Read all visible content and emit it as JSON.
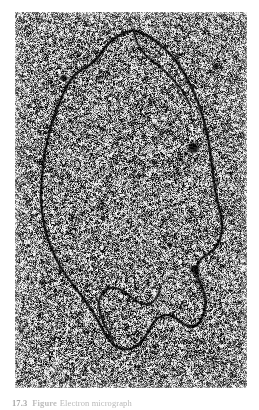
{
  "page": {
    "width": 259,
    "height": 410,
    "background_color": "#ffffff",
    "kind": "printed-book-page-figure"
  },
  "figure": {
    "alt_description": "Transmission electron micrograph of a closed circular DNA molecule spread on a grainy stained support film",
    "plate": {
      "x": 15,
      "y": 12,
      "width": 232,
      "height": 376,
      "background_mean_gray": "#8b8b8b",
      "grain_dark": "#171717",
      "grain_light": "#f2f2f2",
      "contrast_note": "very high contrast speckle, near black-and-white salt-and-pepper grain"
    },
    "specimen": {
      "type": "circular-dna-loop",
      "filament_color": "#0d0d0d",
      "filament_width_px": 2.1,
      "closed": true,
      "description": "single large irregular closed loop filling most of the field, with a crumpled lower-right arc"
    },
    "particles": [
      {
        "name": "dark-particle-upper-right",
        "cx": 193,
        "cy": 148,
        "r": 4.0
      },
      {
        "name": "dark-particle-mid-right",
        "cx": 195,
        "cy": 270,
        "r": 3.4
      },
      {
        "name": "dark-particle-small-left",
        "cx": 64,
        "cy": 78,
        "r": 2.6
      },
      {
        "name": "dark-particle-small-upper",
        "cx": 216,
        "cy": 66,
        "r": 2.2
      },
      {
        "name": "dark-particle-small-lower",
        "cx": 170,
        "cy": 245,
        "r": 2.0
      }
    ]
  },
  "caption": {
    "figure_number": "17.3",
    "lead": "Figure",
    "text": "Electron micrograph",
    "clipped": true,
    "clip_note": "caption is cut off by the bottom edge of the page crop; only the top sliver of the glyphs is visible"
  },
  "colors": {
    "page_background": "#ffffff",
    "plate_mean": "#8b8b8b",
    "grain_dark": "#171717",
    "grain_light": "#f2f2f2",
    "filament": "#0d0d0d",
    "caption_ink": "#b9b9b9"
  },
  "micrograph_geometry": {
    "note": "loop path in plate-local coordinates (0..232 x, 0..376 y)",
    "loop_path": [
      [
        118,
        18
      ],
      [
        103,
        24
      ],
      [
        92,
        33
      ],
      [
        84,
        44
      ],
      [
        76,
        52
      ],
      [
        66,
        58
      ],
      [
        57,
        66
      ],
      [
        50,
        78
      ],
      [
        44,
        92
      ],
      [
        38,
        108
      ],
      [
        33,
        126
      ],
      [
        29,
        146
      ],
      [
        27,
        166
      ],
      [
        26,
        186
      ],
      [
        28,
        206
      ],
      [
        32,
        224
      ],
      [
        38,
        240
      ],
      [
        45,
        254
      ],
      [
        53,
        266
      ],
      [
        62,
        278
      ],
      [
        71,
        290
      ],
      [
        79,
        302
      ],
      [
        86,
        314
      ],
      [
        92,
        325
      ],
      [
        99,
        333
      ],
      [
        108,
        337
      ],
      [
        118,
        336
      ],
      [
        126,
        330
      ],
      [
        132,
        322
      ],
      [
        137,
        313
      ],
      [
        143,
        306
      ],
      [
        151,
        303
      ],
      [
        159,
        305
      ],
      [
        166,
        310
      ],
      [
        173,
        314
      ],
      [
        181,
        313
      ],
      [
        187,
        306
      ],
      [
        190,
        296
      ],
      [
        190,
        285
      ],
      [
        187,
        275
      ],
      [
        183,
        265
      ],
      [
        182,
        255
      ],
      [
        186,
        247
      ],
      [
        193,
        242
      ],
      [
        200,
        236
      ],
      [
        205,
        227
      ],
      [
        207,
        216
      ],
      [
        206,
        204
      ],
      [
        203,
        191
      ],
      [
        200,
        177
      ],
      [
        198,
        162
      ],
      [
        196,
        147
      ],
      [
        194,
        132
      ],
      [
        191,
        117
      ],
      [
        187,
        102
      ],
      [
        182,
        88
      ],
      [
        176,
        74
      ],
      [
        169,
        61
      ],
      [
        161,
        49
      ],
      [
        152,
        39
      ],
      [
        142,
        30
      ],
      [
        131,
        23
      ],
      [
        118,
        18
      ]
    ],
    "inner_branch_path": [
      [
        118,
        18
      ],
      [
        122,
        30
      ],
      [
        128,
        40
      ],
      [
        136,
        48
      ],
      [
        145,
        55
      ],
      [
        154,
        63
      ],
      [
        162,
        72
      ],
      [
        170,
        83
      ],
      [
        176,
        95
      ]
    ],
    "crumple_path": [
      [
        99,
        333
      ],
      [
        95,
        322
      ],
      [
        89,
        312
      ],
      [
        85,
        300
      ],
      [
        84,
        289
      ],
      [
        88,
        280
      ],
      [
        95,
        276
      ],
      [
        104,
        277
      ],
      [
        112,
        282
      ],
      [
        120,
        288
      ],
      [
        128,
        292
      ],
      [
        136,
        291
      ],
      [
        142,
        285
      ],
      [
        145,
        277
      ]
    ]
  }
}
